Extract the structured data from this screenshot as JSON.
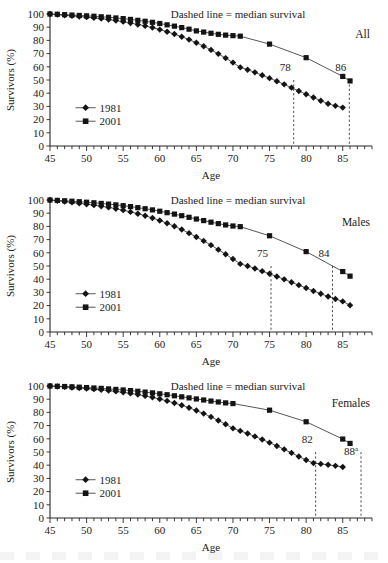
{
  "figure": {
    "background": "#ffffff",
    "ink_color": "#1a1a1a",
    "panel_count": 3
  },
  "axes": {
    "ylabel": "Survivors (%)",
    "xlabel": "Age",
    "y_ticks": [
      0,
      10,
      20,
      30,
      40,
      50,
      60,
      70,
      80,
      90,
      100
    ],
    "x_ticks_labeled": [
      45,
      50,
      55,
      60,
      65,
      70,
      75,
      80,
      85
    ],
    "x_minor_step": 1,
    "xlim": [
      45,
      89
    ],
    "ylim": [
      0,
      100
    ]
  },
  "legend": {
    "entries": [
      {
        "label": "1981",
        "marker": "diamond"
      },
      {
        "label": "2001",
        "marker": "square"
      }
    ]
  },
  "note": "Dashed line = median survival",
  "chart_data": [
    {
      "type": "line",
      "title": "All",
      "panel_label": "All",
      "xlabel": "Age",
      "ylabel": "Survivors (%)",
      "xlim": [
        45,
        89
      ],
      "ylim": [
        0,
        100
      ],
      "grid": false,
      "legend_position": "left-lower",
      "annotations": [
        {
          "text": "Dashed line = median survival",
          "x": 72,
          "y": 96
        },
        {
          "text": "All",
          "x": 86,
          "y": 84
        },
        {
          "text": "78",
          "x": 78,
          "y": 62
        },
        {
          "text": "86",
          "x": 86,
          "y": 62
        }
      ],
      "median_lines": [
        {
          "label": "78",
          "age": 78.3,
          "series": "1981"
        },
        {
          "label": "86",
          "age": 85.9,
          "series": "2001"
        }
      ],
      "x": [
        45,
        46,
        47,
        48,
        49,
        50,
        51,
        52,
        53,
        54,
        55,
        56,
        57,
        58,
        59,
        60,
        61,
        62,
        63,
        64,
        65,
        66,
        67,
        68,
        69,
        70,
        71,
        75,
        80,
        85,
        86
      ],
      "series": [
        {
          "name": "1981",
          "marker": "diamond",
          "values": [
            100,
            99.5,
            99,
            98.6,
            98.1,
            97.6,
            97.1,
            96.5,
            95.8,
            95.0,
            94.2,
            93.2,
            92.1,
            91.0,
            89.7,
            88.2,
            86.6,
            84.8,
            82.8,
            80.6,
            78.2,
            75.6,
            72.8,
            69.8,
            66.6,
            63.2,
            59.6,
            null,
            null,
            null,
            null
          ],
          "sparse_x": [
            72,
            73,
            74,
            75,
            76,
            77,
            78,
            79,
            80,
            81,
            82,
            83,
            84,
            85
          ],
          "sparse_values": [
            57.8,
            55.8,
            53.6,
            51.4,
            49.1,
            46.7,
            44.2,
            41.7,
            39.2,
            36.7,
            34.3,
            32.0,
            30.4,
            29.1
          ]
        },
        {
          "name": "2001",
          "marker": "square",
          "values": [
            100,
            99.8,
            99.5,
            99.2,
            98.9,
            98.6,
            98.3,
            97.9,
            97.5,
            97.0,
            96.5,
            95.9,
            95.2,
            94.5,
            93.7,
            92.8,
            91.8,
            90.8,
            89.7,
            88.5,
            87.2,
            86.3,
            85.4,
            84.6,
            84.0,
            83.6,
            83.2,
            77.2,
            66.9,
            52.7,
            49.3
          ]
        }
      ]
    },
    {
      "type": "line",
      "title": "Males",
      "panel_label": "Males",
      "xlabel": "Age",
      "ylabel": "Survivors (%)",
      "xlim": [
        45,
        89
      ],
      "ylim": [
        0,
        100
      ],
      "grid": false,
      "legend_position": "left-lower",
      "annotations": [
        {
          "text": "Dashed line = median survival",
          "x": 72,
          "y": 96
        },
        {
          "text": "Males",
          "x": 85,
          "y": 82
        },
        {
          "text": "75",
          "x": 75,
          "y": 60
        },
        {
          "text": "84",
          "x": 84,
          "y": 60
        }
      ],
      "median_lines": [
        {
          "label": "75",
          "age": 75.2,
          "series": "1981"
        },
        {
          "label": "84",
          "age": 83.6,
          "series": "2001"
        }
      ],
      "x": [
        45,
        46,
        47,
        48,
        49,
        50,
        51,
        52,
        53,
        54,
        55,
        56,
        57,
        58,
        59,
        60,
        61,
        62,
        63,
        64,
        65,
        66,
        67,
        68,
        69,
        70,
        71,
        75,
        80,
        85,
        86
      ],
      "series": [
        {
          "name": "1981",
          "marker": "diamond",
          "values": [
            100,
            99.4,
            98.8,
            98.2,
            97.5,
            96.8,
            96.1,
            95.3,
            94.4,
            93.4,
            92.3,
            91.0,
            89.6,
            88.1,
            86.4,
            84.5,
            82.4,
            80.1,
            77.6,
            74.9,
            72.0,
            69.0,
            65.8,
            62.4,
            58.9,
            55.3,
            51.6,
            null,
            null,
            null,
            null
          ],
          "sparse_x": [
            72,
            73,
            74,
            75,
            76,
            77,
            78,
            79,
            80,
            81,
            82,
            83,
            84,
            85,
            86
          ],
          "sparse_values": [
            50.0,
            48.1,
            46.1,
            44.1,
            42.0,
            39.9,
            37.7,
            35.5,
            33.3,
            31.1,
            29.0,
            26.9,
            25.0,
            23.2,
            20.3
          ]
        },
        {
          "name": "2001",
          "marker": "square",
          "values": [
            100,
            99.7,
            99.4,
            99.1,
            98.7,
            98.3,
            97.9,
            97.4,
            96.9,
            96.3,
            95.7,
            95.0,
            94.2,
            93.4,
            92.5,
            91.5,
            90.4,
            89.3,
            88.1,
            86.9,
            85.6,
            84.4,
            83.2,
            82.1,
            81.1,
            80.3,
            79.8,
            72.9,
            60.9,
            45.8,
            42.3
          ]
        }
      ]
    },
    {
      "type": "line",
      "title": "Females",
      "panel_label": "Females",
      "xlabel": "Age",
      "ylabel": "Survivors (%)",
      "xlim": [
        45,
        89
      ],
      "ylim": [
        0,
        100
      ],
      "grid": false,
      "legend_position": "left-lower",
      "annotations": [
        {
          "text": "Dashed line = median survival",
          "x": 72,
          "y": 96
        },
        {
          "text": "Females",
          "x": 85,
          "y": 86
        },
        {
          "text": "82",
          "x": 82,
          "y": 58
        },
        {
          "text": "88",
          "x": 88,
          "y": 48,
          "superscript": "a"
        }
      ],
      "median_lines": [
        {
          "label": "82",
          "age": 81.3,
          "series": "1981"
        },
        {
          "label": "88",
          "age": 87.5,
          "series": "2001",
          "superscript": "a"
        }
      ],
      "x": [
        45,
        46,
        47,
        48,
        49,
        50,
        51,
        52,
        53,
        54,
        55,
        56,
        57,
        58,
        59,
        60,
        61,
        62,
        63,
        64,
        65,
        66,
        67,
        68,
        69,
        70,
        75,
        80,
        85,
        86
      ],
      "series": [
        {
          "name": "1981",
          "marker": "diamond",
          "values": [
            100,
            99.6,
            99.3,
            98.9,
            98.5,
            98.1,
            97.6,
            97.1,
            96.5,
            95.9,
            95.2,
            94.4,
            93.5,
            92.5,
            91.4,
            90.1,
            88.7,
            87.1,
            85.4,
            83.5,
            81.4,
            79.1,
            76.6,
            73.9,
            71.0,
            67.9,
            null,
            null,
            null,
            null
          ],
          "sparse_x": [
            71,
            72,
            73,
            74,
            75,
            76,
            77,
            78,
            79,
            80,
            81,
            82,
            83,
            84,
            85
          ],
          "sparse_values": [
            66.0,
            64.0,
            61.8,
            59.5,
            57.1,
            54.6,
            52.0,
            49.3,
            46.6,
            43.9,
            41.6,
            41.0,
            40.3,
            39.5,
            38.6
          ]
        },
        {
          "name": "2001",
          "marker": "square",
          "values": [
            100,
            99.8,
            99.6,
            99.4,
            99.1,
            98.8,
            98.5,
            98.2,
            97.8,
            97.4,
            97.0,
            96.5,
            96.0,
            95.4,
            94.8,
            94.1,
            93.4,
            92.6,
            91.8,
            91.0,
            90.2,
            89.4,
            88.6,
            87.9,
            87.2,
            86.7,
            81.7,
            72.9,
            59.8,
            56.5
          ]
        }
      ]
    }
  ]
}
